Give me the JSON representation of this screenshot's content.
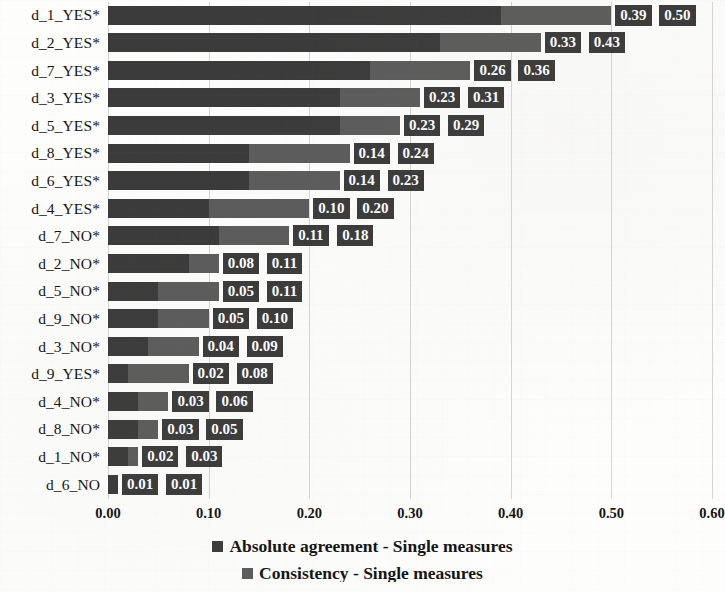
{
  "chart_data": {
    "type": "bar",
    "orientation": "horizontal",
    "title": "",
    "xlabel": "",
    "ylabel": "",
    "xlim": [
      0.0,
      0.6
    ],
    "xticks": [
      "0.00",
      "0.10",
      "0.20",
      "0.30",
      "0.40",
      "0.50",
      "0.60"
    ],
    "xtick_values": [
      0.0,
      0.1,
      0.2,
      0.3,
      0.4,
      0.5,
      0.6
    ],
    "grid": true,
    "grid_axis": "x",
    "legend_position": "bottom",
    "categories": [
      "d_1_YES*",
      "d_2_YES*",
      "d_7_YES*",
      "d_3_YES*",
      "d_5_YES*",
      "d_8_YES*",
      "d_6_YES*",
      "d_4_YES*",
      "d_7_NO*",
      "d_2_NO*",
      "d_5_NO*",
      "d_9_NO*",
      "d_3_NO*",
      "d_9_YES*",
      "d_4_NO*",
      "d_8_NO*",
      "d_1_NO*",
      "d_6_NO"
    ],
    "series": [
      {
        "name": "Absolute agreement - Single measures",
        "color": "#3b3b3b",
        "values": [
          0.39,
          0.33,
          0.26,
          0.23,
          0.23,
          0.14,
          0.14,
          0.1,
          0.11,
          0.08,
          0.05,
          0.05,
          0.04,
          0.02,
          0.03,
          0.03,
          0.02,
          0.01
        ],
        "labels": [
          "0.39",
          "0.33",
          "0.26",
          "0.23",
          "0.23",
          "0.14",
          "0.14",
          "0.10",
          "0.11",
          "0.08",
          "0.05",
          "0.05",
          "0.04",
          "0.02",
          "0.03",
          "0.03",
          "0.02",
          "0.01"
        ]
      },
      {
        "name": "Consistency - Single measures",
        "color": "#5c5c5c",
        "values": [
          0.5,
          0.43,
          0.36,
          0.31,
          0.29,
          0.24,
          0.23,
          0.2,
          0.18,
          0.11,
          0.11,
          0.1,
          0.09,
          0.08,
          0.06,
          0.05,
          0.03,
          0.01
        ],
        "labels": [
          "0.50",
          "0.43",
          "0.36",
          "0.31",
          "0.29",
          "0.24",
          "0.23",
          "0.20",
          "0.18",
          "0.11",
          "0.11",
          "0.10",
          "0.09",
          "0.08",
          "0.06",
          "0.05",
          "0.03",
          "0.01"
        ]
      }
    ]
  },
  "legend": {
    "items": [
      {
        "label": "Absolute agreement - Single measures",
        "swatch": "#3b3b3b"
      },
      {
        "label": "Consistency - Single measures",
        "swatch": "#5c5c5c"
      }
    ]
  }
}
